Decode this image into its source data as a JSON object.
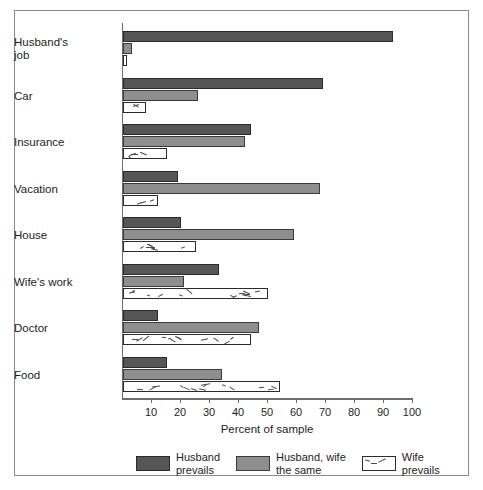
{
  "chart_data": {
    "type": "bar",
    "orientation": "horizontal",
    "title": "",
    "xlabel": "Percent of sample",
    "ylabel": "",
    "xlim": [
      0,
      100
    ],
    "xticks": [
      10,
      20,
      30,
      40,
      50,
      60,
      70,
      80,
      90,
      100
    ],
    "grid": false,
    "legend_position": "bottom",
    "categories": [
      "Husband's\njob",
      "Car",
      "Insurance",
      "Vacation",
      "House",
      "Wife's work",
      "Doctor",
      "Food"
    ],
    "series": [
      {
        "name": "Husband\nprevails",
        "color": "#565656",
        "values": [
          93,
          69,
          44,
          19,
          20,
          33,
          12,
          15
        ]
      },
      {
        "name": "Husband, wife\nthe same",
        "color": "#8e8e8e",
        "values": [
          3,
          26,
          42,
          68,
          59,
          21,
          47,
          34
        ]
      },
      {
        "name": "Wife\nprevails",
        "color": "#ffffff",
        "values": [
          1.5,
          8,
          15,
          12,
          25,
          50,
          44,
          54
        ]
      }
    ]
  },
  "legend": {
    "entries": [
      {
        "label": "Husband\nprevails",
        "style": "dark"
      },
      {
        "label": "Husband, wife\nthe same",
        "style": "medium"
      },
      {
        "label": "Wife\nprevails",
        "style": "light"
      }
    ]
  },
  "axis": {
    "x_title": "Percent of sample",
    "tick_labels": [
      "10",
      "20",
      "30",
      "40",
      "50",
      "60",
      "70",
      "80",
      "90",
      "100"
    ]
  }
}
